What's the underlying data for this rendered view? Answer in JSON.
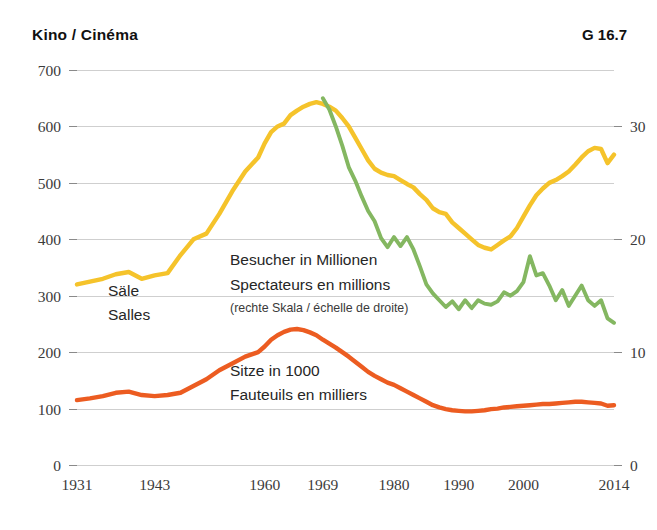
{
  "header": {
    "title": "Kino / Cinéma",
    "code": "G 16.7"
  },
  "annotations": {
    "yellow_label_line1": "Säle",
    "yellow_label_line2": "Salles",
    "green_label_line1": "Besucher in Millionen",
    "green_label_line2": "Spectateurs en millions",
    "green_label_line3": "(rechte Skala / échelle de droite)",
    "orange_label_line1": "Sitze in 1000",
    "orange_label_line2": "Fauteuils en milliers"
  },
  "colors": {
    "yellow": "#F5C32B",
    "green": "#84B761",
    "orange": "#EC5C21",
    "grid": "#cfcfcf",
    "text": "#262626"
  },
  "chart_data": {
    "type": "line",
    "title": "Kino / Cinéma",
    "xlabel": "",
    "ylabel": "",
    "grid": true,
    "legend": "inline-annotations",
    "x": [
      1931,
      2014
    ],
    "xlim": [
      1931,
      2014
    ],
    "xticks": [
      1931,
      1943,
      1960,
      1969,
      1980,
      1990,
      2000,
      2014
    ],
    "xticklabels": [
      "1931",
      "1943",
      "1960",
      "1969",
      "1980",
      "1990",
      "2000",
      "2014"
    ],
    "left_axis": {
      "label": "Säle / Salles; Sitze in 1000 / Fauteuils en milliers",
      "ylim": [
        0,
        700
      ],
      "yticks": [
        0,
        100,
        200,
        300,
        400,
        500,
        600,
        700
      ],
      "yticklabels": [
        "0",
        "100",
        "200",
        "300",
        "400",
        "500",
        "600",
        "700"
      ]
    },
    "right_axis": {
      "label": "Besucher in Millionen / Spectateurs en millions",
      "ylim": [
        0,
        35
      ],
      "yticks": [
        0,
        10,
        20,
        30
      ],
      "yticklabels": [
        "0",
        "10",
        "20",
        "30"
      ]
    },
    "series": [
      {
        "name": "Säle / Salles",
        "axis": "left",
        "color": "#F5C32B",
        "unit": "Anzahl / nombre",
        "x": [
          1931,
          1933,
          1935,
          1937,
          1939,
          1941,
          1943,
          1945,
          1947,
          1949,
          1951,
          1953,
          1955,
          1957,
          1959,
          1960,
          1961,
          1962,
          1963,
          1964,
          1965,
          1966,
          1967,
          1968,
          1969,
          1970,
          1971,
          1972,
          1973,
          1974,
          1975,
          1976,
          1977,
          1978,
          1979,
          1980,
          1981,
          1982,
          1983,
          1984,
          1985,
          1986,
          1987,
          1988,
          1989,
          1990,
          1991,
          1992,
          1993,
          1994,
          1995,
          1996,
          1997,
          1998,
          1999,
          2000,
          2001,
          2002,
          2003,
          2004,
          2005,
          2006,
          2007,
          2008,
          2009,
          2010,
          2011,
          2012,
          2013,
          2014
        ],
        "values": [
          320,
          325,
          330,
          338,
          342,
          330,
          336,
          340,
          372,
          400,
          410,
          445,
          485,
          520,
          545,
          570,
          590,
          600,
          605,
          620,
          628,
          635,
          640,
          643,
          640,
          635,
          628,
          615,
          600,
          580,
          560,
          540,
          525,
          518,
          514,
          512,
          505,
          498,
          492,
          480,
          470,
          455,
          448,
          445,
          430,
          420,
          410,
          400,
          390,
          385,
          382,
          390,
          398,
          405,
          420,
          440,
          460,
          478,
          490,
          500,
          505,
          512,
          520,
          532,
          545,
          556,
          562,
          560,
          535,
          550
        ]
      },
      {
        "name": "Besucher in Millionen / Spectateurs en millions",
        "axis": "right",
        "color": "#84B761",
        "unit": "Millionen / millions",
        "x": [
          1969,
          1970,
          1971,
          1972,
          1973,
          1974,
          1975,
          1976,
          1977,
          1978,
          1979,
          1980,
          1981,
          1982,
          1983,
          1984,
          1985,
          1986,
          1987,
          1988,
          1989,
          1990,
          1991,
          1992,
          1993,
          1994,
          1995,
          1996,
          1997,
          1998,
          1999,
          2000,
          2001,
          2002,
          2003,
          2004,
          2005,
          2006,
          2007,
          2008,
          2009,
          2010,
          2011,
          2012,
          2013,
          2014
        ],
        "values": [
          32.5,
          31.5,
          30.0,
          28.3,
          26.4,
          25.2,
          23.8,
          22.5,
          21.6,
          20.1,
          19.3,
          20.2,
          19.4,
          20.2,
          19.1,
          17.6,
          16.0,
          15.2,
          14.6,
          14.0,
          14.5,
          13.8,
          14.6,
          13.9,
          14.6,
          14.3,
          14.2,
          14.5,
          15.3,
          15.0,
          15.4,
          16.2,
          18.5,
          16.8,
          17.0,
          15.9,
          14.6,
          15.5,
          14.1,
          15.0,
          15.9,
          14.6,
          14.1,
          14.6,
          13.0,
          12.6
        ]
      },
      {
        "name": "Sitze in 1000 / Fauteuils en milliers",
        "axis": "left",
        "color": "#EC5C21",
        "unit": "1000",
        "x": [
          1931,
          1933,
          1935,
          1937,
          1939,
          1941,
          1943,
          1945,
          1947,
          1949,
          1951,
          1953,
          1955,
          1957,
          1959,
          1960,
          1961,
          1962,
          1963,
          1964,
          1965,
          1966,
          1967,
          1968,
          1969,
          1970,
          1971,
          1972,
          1973,
          1974,
          1975,
          1976,
          1977,
          1978,
          1979,
          1980,
          1981,
          1982,
          1983,
          1984,
          1985,
          1986,
          1987,
          1988,
          1989,
          1990,
          1991,
          1992,
          1993,
          1994,
          1995,
          1996,
          1997,
          1998,
          1999,
          2000,
          2001,
          2002,
          2003,
          2004,
          2005,
          2006,
          2007,
          2008,
          2009,
          2010,
          2011,
          2012,
          2013,
          2014
        ],
        "values": [
          115,
          118,
          122,
          128,
          130,
          124,
          122,
          124,
          128,
          140,
          152,
          168,
          180,
          192,
          200,
          210,
          222,
          230,
          236,
          240,
          241,
          239,
          235,
          230,
          222,
          215,
          208,
          200,
          192,
          183,
          174,
          165,
          158,
          152,
          146,
          142,
          136,
          130,
          124,
          118,
          112,
          106,
          102,
          99,
          97,
          96,
          95,
          95,
          96,
          97,
          99,
          100,
          102,
          103,
          104,
          105,
          106,
          107,
          108,
          108,
          109,
          110,
          111,
          112,
          112,
          111,
          110,
          109,
          105,
          106
        ]
      }
    ]
  }
}
